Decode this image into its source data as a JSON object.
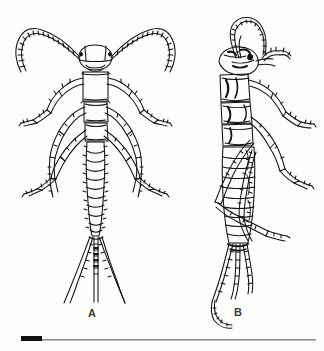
{
  "plate": {
    "background_color": "#fdfdfc",
    "ink_color": "#111111",
    "rule_color": "#8d8d8d",
    "width_px": 324,
    "height_px": 351
  },
  "figures": [
    {
      "id": "A",
      "label": "A",
      "view": "dorsal",
      "subject": "insect nymph",
      "description": "Dorsal view of a segmented insect nymph with two long curved annulated antennae sweeping outward, three pairs of legs, a ten-segmented abdomen and three terminal caudal filaments."
    },
    {
      "id": "B",
      "label": "B",
      "view": "lateral",
      "subject": "insect nymph",
      "description": "Lateral view of the same insect nymph with antennae arching up and forward over the head, legs extending to the right, and caudal filaments trailing below."
    }
  ],
  "scale_bar": {
    "name": "scale-bar",
    "bar_color": "#111111",
    "rule_color": "#8d8d8d",
    "label": ""
  }
}
